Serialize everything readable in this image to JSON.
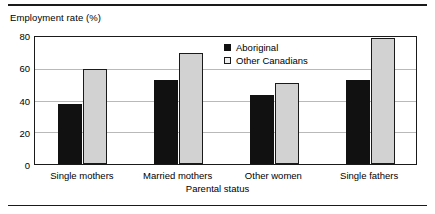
{
  "chart_data": {
    "type": "bar",
    "title": "",
    "subtitle": "",
    "ylabel": "Employment rate (%)",
    "xlabel": "Parental status",
    "categories": [
      "Single mothers",
      "Married mothers",
      "Other women",
      "Single fathers"
    ],
    "series": [
      {
        "name": "Aboriginal",
        "values": [
          37,
          52,
          43,
          52
        ],
        "color": "#111111"
      },
      {
        "name": "Other Canadians",
        "values": [
          59,
          69,
          50,
          78
        ],
        "color": "#d2d2d2"
      }
    ],
    "ylim": [
      0,
      80
    ],
    "yticks": [
      0,
      20,
      40,
      60,
      80
    ],
    "ytick_labels": [
      "0",
      "20",
      "40",
      "60",
      "80"
    ],
    "grid": true,
    "grid_axis": "y",
    "legend_position": "inside-top-center",
    "orientation": "vertical",
    "grouping": "grouped"
  }
}
